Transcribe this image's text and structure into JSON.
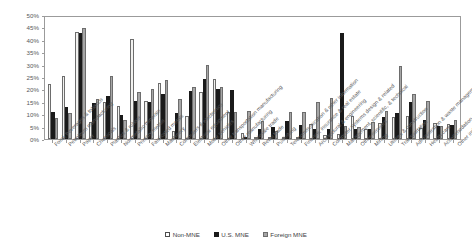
{
  "chart_data": {
    "type": "bar",
    "title": "",
    "xlabel": "",
    "ylabel": "",
    "ylim": [
      0,
      50
    ],
    "ytick_labels": [
      "50%",
      "45%",
      "40%",
      "35%",
      "30%",
      "25%",
      "20%",
      "15%",
      "10%",
      "5%",
      "0%"
    ],
    "ytick_values": [
      50,
      45,
      40,
      35,
      30,
      25,
      20,
      15,
      10,
      5,
      0
    ],
    "grid": false,
    "legend_position": "bottom",
    "categories": [
      "Food, beverages & tobacco",
      "Petroleum manufacturing",
      "Paper",
      "Chemicals",
      "Plastics & rubber",
      "Nonmetallic minerals",
      "Primary metals",
      "Fabricated metals",
      "Machinery",
      "Computers & electronics",
      "Electrical equipment",
      "Motor vehicles",
      "Other transportation manufacturing",
      "Other manufacturing",
      "Wholesale trade",
      "Retail trade",
      "Publishing",
      "Telecommunication & other information",
      "Finance, insurance & real estate",
      "Architectural & engineering",
      "Computer systems design & related",
      "Management, scientific, & technical",
      "Other services",
      "Mining",
      "Utilities & construction",
      "Transportation",
      "Administration & waste management",
      "Health care",
      "Accommodation & food",
      "Other industries"
    ],
    "series": [
      {
        "name": "Non-MNE",
        "color": "#f2f2f0",
        "values": [
          22.2,
          25.6,
          43.0,
          7.0,
          15.0,
          13.5,
          40.5,
          15.5,
          22.5,
          3.4,
          9.3,
          19.0,
          24.0,
          10.7,
          2.5,
          0.4,
          1.0,
          0.9,
          0.7,
          6.0,
          1.8,
          2.0,
          9.3,
          4.0,
          6.4,
          8.7,
          9.3,
          4.4,
          6.3,
          6.1
        ]
      },
      {
        "name": "U.S. MNE",
        "color": "#1a1a1a",
        "values": [
          11.0,
          13.0,
          42.6,
          14.5,
          17.5,
          9.5,
          15.5,
          15.0,
          18.3,
          10.4,
          19.5,
          24.3,
          20.3,
          19.6,
          0.5,
          4.0,
          5.0,
          7.2,
          5.7,
          4.0,
          4.1,
          42.7,
          4.2,
          4.2,
          8.8,
          10.4,
          14.9,
          7.5,
          5.3,
          5.8
        ]
      },
      {
        "name": "Foreign MNE",
        "color": "#a6a6a6",
        "values": [
          8.3,
          10.6,
          44.6,
          16.0,
          25.5,
          7.5,
          19.0,
          20.0,
          23.8,
          16.0,
          21.0,
          30.0,
          21.0,
          11.0,
          11.2,
          7.3,
          3.3,
          10.8,
          10.8,
          14.8,
          16.7,
          5.4,
          5.0,
          6.8,
          11.2,
          29.5,
          18.2,
          15.4,
          5.3,
          7.6
        ]
      }
    ]
  },
  "legend": {
    "items": [
      {
        "label": "Non-MNE"
      },
      {
        "label": "U.S. MNE"
      },
      {
        "label": "Foreign MNE"
      }
    ]
  },
  "colors": {
    "non_mne": "#f2f2f0",
    "us_mne": "#1a1a1a",
    "foreign_mne": "#a6a6a6",
    "axis": "#9b9b9b",
    "text": "#5c5c5e"
  }
}
